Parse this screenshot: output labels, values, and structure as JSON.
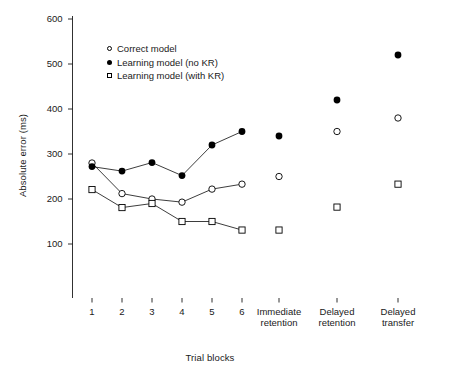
{
  "chart_data": {
    "type": "line",
    "title": "",
    "xlabel": "Trial blocks",
    "ylabel": "Absolute error (ms)",
    "ylim": [
      50,
      620
    ],
    "yticks": [
      100,
      200,
      300,
      400,
      500,
      600
    ],
    "ytick_labels": [
      "100",
      "200",
      "300",
      "400",
      "500",
      "600"
    ],
    "grid": false,
    "legend_position": "upper-left-inside",
    "categories": [
      "1",
      "2",
      "3",
      "4",
      "5",
      "6",
      "Immediate retention",
      "Delayed retention",
      "Delayed transfer"
    ],
    "xtick_labels": [
      {
        "line1": "1",
        "line2": ""
      },
      {
        "line1": "2",
        "line2": ""
      },
      {
        "line1": "3",
        "line2": ""
      },
      {
        "line1": "4",
        "line2": ""
      },
      {
        "line1": "5",
        "line2": ""
      },
      {
        "line1": "6",
        "line2": ""
      },
      {
        "line1": "Immediate",
        "line2": "retention"
      },
      {
        "line1": "Delayed",
        "line2": "retention"
      },
      {
        "line1": "Delayed",
        "line2": "transfer"
      }
    ],
    "series": [
      {
        "name": "Correct model",
        "marker": "open-circle",
        "connected_blocks": [
          280,
          212,
          200,
          193,
          222,
          233
        ],
        "test_values": [
          250,
          350,
          380
        ]
      },
      {
        "name": "Learning model (no KR)",
        "marker": "filled-circle",
        "connected_blocks": [
          272,
          262,
          281,
          252,
          320,
          350
        ],
        "test_values": [
          340,
          420,
          520
        ]
      },
      {
        "name": "Learning model (with KR)",
        "marker": "open-square",
        "connected_blocks": [
          221,
          181,
          190,
          150,
          150,
          131
        ],
        "test_values": [
          131,
          182,
          233
        ]
      }
    ],
    "legend": [
      {
        "label": "Correct model",
        "marker": "open-circle"
      },
      {
        "label": "Learning model (no KR)",
        "marker": "filled-circle"
      },
      {
        "label": "Learning model (with KR)",
        "marker": "open-square"
      }
    ]
  },
  "colors": {
    "line": "#1a1a1a",
    "axis": "#1a1a1a",
    "background": "#ffffff"
  }
}
